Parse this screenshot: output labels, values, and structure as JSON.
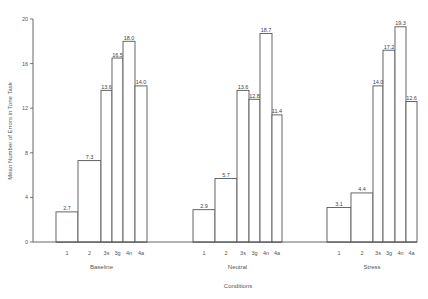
{
  "chart_data": {
    "type": "bar",
    "title": "",
    "xlabel": "Conditions",
    "ylabel": "Mean Number of Errors in Tone Task",
    "ylim": [
      0,
      20
    ],
    "yticks": [
      0,
      4,
      8,
      12,
      16,
      20
    ],
    "grid": false,
    "legend": null,
    "groups": [
      {
        "name": "Baseline",
        "categories": [
          "1",
          "2",
          "3s",
          "3g",
          "4n",
          "4a"
        ],
        "values": [
          2.7,
          7.3,
          13.6,
          16.5,
          18.0,
          14.0
        ]
      },
      {
        "name": "Neutral",
        "categories": [
          "1",
          "2",
          "3s",
          "3g",
          "4n",
          "4a"
        ],
        "values": [
          2.9,
          5.7,
          13.6,
          12.8,
          18.7,
          11.4
        ]
      },
      {
        "name": "Stress",
        "categories": [
          "1",
          "2",
          "3s",
          "3g",
          "4n",
          "4a"
        ],
        "values": [
          3.1,
          4.4,
          14.0,
          17.2,
          19.3,
          12.6
        ]
      }
    ]
  },
  "labels": {
    "xlabel": "Conditions",
    "ylabel": "Mean Number of Errors in Tone Task",
    "groups": [
      "Baseline",
      "Neutral",
      "Stress"
    ],
    "yticks": [
      "0",
      "4",
      "8",
      "12",
      "16",
      "20"
    ]
  },
  "colors": {
    "line": "#555555",
    "fill": "#ffffff"
  }
}
